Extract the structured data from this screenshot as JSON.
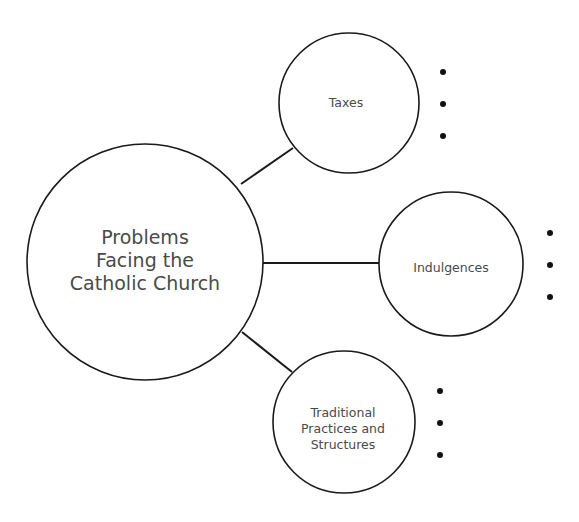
{
  "diagram": {
    "central": {
      "lines": [
        "Problems",
        "Facing the",
        "Catholic Church"
      ]
    },
    "branches": [
      {
        "id": "taxes",
        "lines": [
          "Taxes"
        ],
        "bullets": [
          "",
          "",
          ""
        ]
      },
      {
        "id": "indulgences",
        "lines": [
          "Indulgences"
        ],
        "bullets": [
          "",
          "",
          ""
        ]
      },
      {
        "id": "traditional",
        "lines": [
          "Traditional",
          "Practices and",
          "Structures"
        ],
        "bullets": [
          "",
          "",
          ""
        ]
      }
    ],
    "colors": {
      "stroke": "#1a1a1a",
      "text": "#4a4a4a",
      "background": "#ffffff"
    }
  }
}
